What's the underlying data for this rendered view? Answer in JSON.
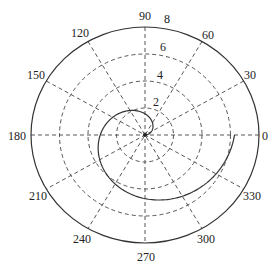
{
  "chart_data": {
    "type": "line",
    "subtype": "polar",
    "title": "",
    "function": "r = theta, theta in [0, 2*pi]",
    "theta_unit": "degrees",
    "angle_ticks": [
      0,
      30,
      60,
      90,
      120,
      150,
      180,
      210,
      240,
      270,
      300,
      330
    ],
    "angle_tick_labels": [
      "0",
      "30",
      "60",
      "90",
      "120",
      "150",
      "180",
      "210",
      "240",
      "270",
      "300",
      "330"
    ],
    "radial_ticks": [
      2,
      4,
      6,
      8
    ],
    "radial_tick_labels": [
      "2",
      "4",
      "6",
      "8"
    ],
    "rlim": [
      0,
      8
    ],
    "grid": true,
    "grid_style": "dashed",
    "series": [
      {
        "name": "spiral",
        "theta_deg": [
          0,
          30,
          60,
          90,
          120,
          150,
          180,
          210,
          240,
          270,
          300,
          330,
          360
        ],
        "r": [
          0,
          0.52,
          1.05,
          1.57,
          2.09,
          2.62,
          3.14,
          3.67,
          4.19,
          4.71,
          5.24,
          5.76,
          6.28
        ]
      }
    ],
    "colors": {
      "line": "#333333",
      "grid": "#444444",
      "background": "#ffffff"
    }
  }
}
